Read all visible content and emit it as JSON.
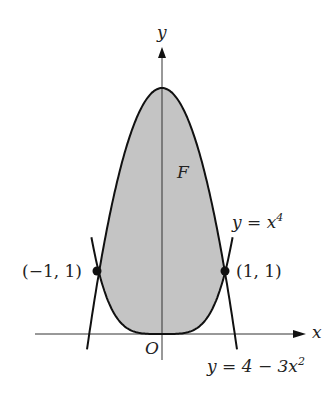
{
  "figure": {
    "axis_x_label": "x",
    "axis_y_label": "y",
    "origin_label": "O",
    "region_label": "F",
    "point_left_label": "(−1, 1)",
    "point_right_label": "(1, 1)",
    "curve_quartic_label": "y = x",
    "curve_quartic_exp": "4",
    "curve_parabola_label": "y = 4 − 3x",
    "curve_parabola_exp": "2",
    "colors": {
      "fill": "#c4c4c4",
      "stroke": "#111111",
      "axis": "#333333"
    }
  },
  "chart_data": {
    "type": "area",
    "title": "",
    "xlabel": "x",
    "ylabel": "y",
    "series": [
      {
        "name": "y = x^4",
        "expr": "x^4"
      },
      {
        "name": "y = 4 - 3x^2",
        "expr": "4 - 3x^2"
      }
    ],
    "shaded_region": {
      "name": "F",
      "between": [
        "y = x^4",
        "y = 4 - 3x^2"
      ],
      "x_range": [
        -1,
        1
      ]
    },
    "points": [
      {
        "label": "(-1, 1)",
        "x": -1,
        "y": 1
      },
      {
        "label": "(1, 1)",
        "x": 1,
        "y": 1
      }
    ],
    "grid": false
  }
}
